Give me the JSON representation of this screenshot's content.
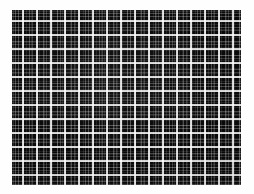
{
  "image": {
    "title": "Plaid / tartan fabric swatch",
    "subject": "black and white checked woven textile",
    "caption": "",
    "frame": {
      "left_px": 12,
      "top_px": 10,
      "width_px": 229,
      "height_px": 175
    },
    "canvas": {
      "width_px": 254,
      "height_px": 194,
      "background_color": "#fefefe"
    }
  },
  "pattern": {
    "type": "plaid-grid",
    "cell_period_px": 14,
    "orientation": "orthogonal warp and weft",
    "major_line_width_px": 1.6,
    "minor_line_width_px": 1.0,
    "colors": {
      "ground": "#090909",
      "dark_square": "#141414",
      "mid_grey": "#555555",
      "light_grey": "#9a9a9a",
      "highlight": "#d8d8d8",
      "border": "#fefefe"
    },
    "counts": {
      "vertical_major_lines": 16,
      "horizontal_major_lines": 12
    }
  }
}
